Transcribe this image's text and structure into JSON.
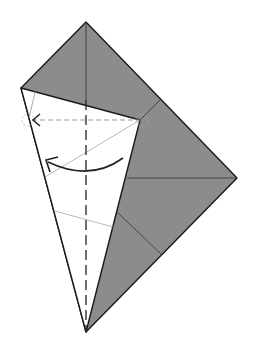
{
  "diagram": {
    "colors": {
      "paper_back": "#8c8c8c",
      "paper_front": "#ffffff",
      "edge": "#1a1a1a",
      "crease": "#777777",
      "guide": "#999999"
    },
    "points": {
      "top": [
        86,
        22
      ],
      "left": [
        21,
        88
      ],
      "right": [
        237,
        178
      ],
      "bottom": [
        86,
        332
      ],
      "inner_corner": [
        140,
        120
      ],
      "flap_top": [
        160,
        100
      ]
    },
    "labels": {
      "fold_arrow": "fold-arrow",
      "valley_fold": "valley-fold-line",
      "guide_line": "alignment-guide"
    }
  }
}
